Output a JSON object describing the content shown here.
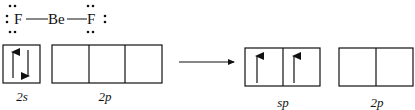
{
  "lewis": {
    "left_atom": "F",
    "center_atom": "Be",
    "right_atom": "F"
  },
  "ground_state": {
    "s_label": "2s",
    "p_label": "2p",
    "s_orbitals": [
      {
        "electrons": [
          "up",
          "down"
        ]
      }
    ],
    "p_orbitals": [
      {
        "electrons": []
      },
      {
        "electrons": []
      },
      {
        "electrons": []
      }
    ]
  },
  "hybridized_state": {
    "sp_label": "sp",
    "p_label": "2p",
    "sp_orbitals": [
      {
        "electrons": [
          "up"
        ]
      },
      {
        "electrons": [
          "up"
        ]
      }
    ],
    "p_orbitals": [
      {
        "electrons": []
      },
      {
        "electrons": []
      }
    ]
  },
  "transition_arrow": "right-arrow"
}
